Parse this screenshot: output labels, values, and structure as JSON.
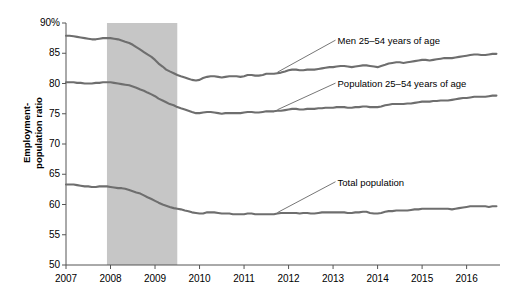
{
  "chart_data": {
    "type": "line",
    "title": "",
    "xlabel": "",
    "ylabel": "Employment-population ratio",
    "ylabel_line1": "Employment-",
    "ylabel_line2": "population ratio",
    "ylim": [
      50,
      90
    ],
    "ytick_values": [
      90,
      85,
      80,
      75,
      70,
      65,
      60,
      55,
      50
    ],
    "ytick_labels": [
      "90%",
      "85",
      "80",
      "75",
      "70",
      "65",
      "60",
      "55",
      "50"
    ],
    "xlim": [
      2007.0,
      2016.75
    ],
    "xtick_values": [
      2007,
      2008,
      2009,
      2010,
      2011,
      2012,
      2013,
      2014,
      2015,
      2016
    ],
    "xtick_labels": [
      "2007",
      "2008",
      "2009",
      "2010",
      "2011",
      "2012",
      "2013",
      "2014",
      "2015",
      "2016"
    ],
    "grid": false,
    "legend_position": "inline-annotations",
    "line_color": "#6e6e6e",
    "recession_band": {
      "label": "recession shading",
      "x_start": 2007.92,
      "x_end": 2009.5,
      "color": "#c6c6c6"
    },
    "annotations": [
      {
        "name": "men-25-54-label",
        "text": "Men 25–54 years of age",
        "x": 2013.1,
        "y": 87.0
      },
      {
        "name": "population-25-54-label",
        "text": "Population 25–54 years of age",
        "x": 2013.1,
        "y": 79.9
      },
      {
        "name": "total-population-label",
        "text": "Total population",
        "x": 2013.1,
        "y": 63.6
      }
    ],
    "series": [
      {
        "name": "Men 25–54 years of age",
        "color": "#6e6e6e",
        "x": [
          2007.0,
          2007.08,
          2007.17,
          2007.25,
          2007.33,
          2007.42,
          2007.5,
          2007.58,
          2007.67,
          2007.75,
          2007.83,
          2007.92,
          2008.0,
          2008.08,
          2008.17,
          2008.25,
          2008.33,
          2008.42,
          2008.5,
          2008.58,
          2008.67,
          2008.75,
          2008.83,
          2008.92,
          2009.0,
          2009.08,
          2009.17,
          2009.25,
          2009.33,
          2009.42,
          2009.5,
          2009.58,
          2009.67,
          2009.75,
          2009.83,
          2009.92,
          2010.0,
          2010.08,
          2010.17,
          2010.25,
          2010.33,
          2010.42,
          2010.5,
          2010.58,
          2010.67,
          2010.75,
          2010.83,
          2010.92,
          2011.0,
          2011.08,
          2011.17,
          2011.25,
          2011.33,
          2011.42,
          2011.5,
          2011.58,
          2011.67,
          2011.75,
          2011.83,
          2011.92,
          2012.0,
          2012.08,
          2012.17,
          2012.25,
          2012.33,
          2012.42,
          2012.5,
          2012.58,
          2012.67,
          2012.75,
          2012.83,
          2012.92,
          2013.0,
          2013.08,
          2013.17,
          2013.25,
          2013.33,
          2013.42,
          2013.5,
          2013.58,
          2013.67,
          2013.75,
          2013.83,
          2013.92,
          2014.0,
          2014.08,
          2014.17,
          2014.25,
          2014.33,
          2014.42,
          2014.5,
          2014.58,
          2014.67,
          2014.75,
          2014.83,
          2014.92,
          2015.0,
          2015.08,
          2015.17,
          2015.25,
          2015.33,
          2015.42,
          2015.5,
          2015.58,
          2015.67,
          2015.75,
          2015.83,
          2015.92,
          2016.0,
          2016.08,
          2016.17,
          2016.25,
          2016.33,
          2016.42,
          2016.5,
          2016.58,
          2016.67
        ],
        "values": [
          87.9,
          87.9,
          87.8,
          87.7,
          87.6,
          87.5,
          87.4,
          87.3,
          87.3,
          87.4,
          87.5,
          87.5,
          87.5,
          87.4,
          87.3,
          87.1,
          86.9,
          86.7,
          86.4,
          86.0,
          85.6,
          85.2,
          84.8,
          84.4,
          83.9,
          83.3,
          82.8,
          82.3,
          82.0,
          81.7,
          81.4,
          81.2,
          81.0,
          80.8,
          80.6,
          80.5,
          80.6,
          80.9,
          81.1,
          81.2,
          81.2,
          81.1,
          81.0,
          81.1,
          81.2,
          81.2,
          81.2,
          81.1,
          81.2,
          81.4,
          81.4,
          81.3,
          81.3,
          81.4,
          81.6,
          81.6,
          81.6,
          81.7,
          81.8,
          82.0,
          82.2,
          82.3,
          82.3,
          82.2,
          82.2,
          82.3,
          82.3,
          82.3,
          82.4,
          82.5,
          82.6,
          82.7,
          82.7,
          82.8,
          82.9,
          82.9,
          82.8,
          82.7,
          82.8,
          82.9,
          83.0,
          83.0,
          82.9,
          82.8,
          82.7,
          82.9,
          83.1,
          83.3,
          83.4,
          83.5,
          83.5,
          83.4,
          83.5,
          83.6,
          83.7,
          83.8,
          83.9,
          83.9,
          83.8,
          83.9,
          84.0,
          84.1,
          84.2,
          84.2,
          84.2,
          84.3,
          84.4,
          84.5,
          84.6,
          84.7,
          84.8,
          84.8,
          84.7,
          84.7,
          84.8,
          84.9,
          84.9
        ]
      },
      {
        "name": "Population 25–54 years of age",
        "color": "#6e6e6e",
        "x": [
          2007.0,
          2007.08,
          2007.17,
          2007.25,
          2007.33,
          2007.42,
          2007.5,
          2007.58,
          2007.67,
          2007.75,
          2007.83,
          2007.92,
          2008.0,
          2008.08,
          2008.17,
          2008.25,
          2008.33,
          2008.42,
          2008.5,
          2008.58,
          2008.67,
          2008.75,
          2008.83,
          2008.92,
          2009.0,
          2009.08,
          2009.17,
          2009.25,
          2009.33,
          2009.42,
          2009.5,
          2009.58,
          2009.67,
          2009.75,
          2009.83,
          2009.92,
          2010.0,
          2010.08,
          2010.17,
          2010.25,
          2010.33,
          2010.42,
          2010.5,
          2010.58,
          2010.67,
          2010.75,
          2010.83,
          2010.92,
          2011.0,
          2011.08,
          2011.17,
          2011.25,
          2011.33,
          2011.42,
          2011.5,
          2011.58,
          2011.67,
          2011.75,
          2011.83,
          2011.92,
          2012.0,
          2012.08,
          2012.17,
          2012.25,
          2012.33,
          2012.42,
          2012.5,
          2012.58,
          2012.67,
          2012.75,
          2012.83,
          2012.92,
          2013.0,
          2013.08,
          2013.17,
          2013.25,
          2013.33,
          2013.42,
          2013.5,
          2013.58,
          2013.67,
          2013.75,
          2013.83,
          2013.92,
          2014.0,
          2014.08,
          2014.17,
          2014.25,
          2014.33,
          2014.42,
          2014.5,
          2014.58,
          2014.67,
          2014.75,
          2014.83,
          2014.92,
          2015.0,
          2015.08,
          2015.17,
          2015.25,
          2015.33,
          2015.42,
          2015.5,
          2015.58,
          2015.67,
          2015.75,
          2015.83,
          2015.92,
          2016.0,
          2016.08,
          2016.17,
          2016.25,
          2016.33,
          2016.42,
          2016.5,
          2016.58,
          2016.67
        ],
        "values": [
          80.2,
          80.2,
          80.2,
          80.1,
          80.1,
          80.0,
          80.0,
          80.0,
          80.1,
          80.1,
          80.2,
          80.2,
          80.2,
          80.1,
          80.0,
          79.9,
          79.8,
          79.7,
          79.5,
          79.3,
          79.0,
          78.8,
          78.5,
          78.2,
          77.9,
          77.5,
          77.2,
          76.9,
          76.6,
          76.4,
          76.1,
          75.9,
          75.7,
          75.5,
          75.3,
          75.1,
          75.1,
          75.2,
          75.3,
          75.3,
          75.2,
          75.1,
          75.0,
          75.1,
          75.1,
          75.1,
          75.1,
          75.1,
          75.2,
          75.3,
          75.3,
          75.2,
          75.2,
          75.3,
          75.4,
          75.4,
          75.4,
          75.5,
          75.5,
          75.6,
          75.7,
          75.8,
          75.8,
          75.7,
          75.7,
          75.8,
          75.8,
          75.8,
          75.9,
          75.9,
          76.0,
          76.0,
          76.0,
          76.1,
          76.1,
          76.1,
          76.0,
          76.0,
          76.1,
          76.1,
          76.2,
          76.2,
          76.1,
          76.1,
          76.1,
          76.2,
          76.4,
          76.5,
          76.6,
          76.6,
          76.6,
          76.6,
          76.7,
          76.7,
          76.8,
          76.9,
          77.0,
          77.0,
          77.0,
          77.1,
          77.1,
          77.2,
          77.2,
          77.2,
          77.3,
          77.4,
          77.5,
          77.6,
          77.6,
          77.7,
          77.8,
          77.8,
          77.8,
          77.8,
          77.9,
          78.0,
          78.0
        ]
      },
      {
        "name": "Total population",
        "color": "#6e6e6e",
        "x": [
          2007.0,
          2007.08,
          2007.17,
          2007.25,
          2007.33,
          2007.42,
          2007.5,
          2007.58,
          2007.67,
          2007.75,
          2007.83,
          2007.92,
          2008.0,
          2008.08,
          2008.17,
          2008.25,
          2008.33,
          2008.42,
          2008.5,
          2008.58,
          2008.67,
          2008.75,
          2008.83,
          2008.92,
          2009.0,
          2009.08,
          2009.17,
          2009.25,
          2009.33,
          2009.42,
          2009.5,
          2009.58,
          2009.67,
          2009.75,
          2009.83,
          2009.92,
          2010.0,
          2010.08,
          2010.17,
          2010.25,
          2010.33,
          2010.42,
          2010.5,
          2010.58,
          2010.67,
          2010.75,
          2010.83,
          2010.92,
          2011.0,
          2011.08,
          2011.17,
          2011.25,
          2011.33,
          2011.42,
          2011.5,
          2011.58,
          2011.67,
          2011.75,
          2011.83,
          2011.92,
          2012.0,
          2012.08,
          2012.17,
          2012.25,
          2012.33,
          2012.42,
          2012.5,
          2012.58,
          2012.67,
          2012.75,
          2012.83,
          2012.92,
          2013.0,
          2013.08,
          2013.17,
          2013.25,
          2013.33,
          2013.42,
          2013.5,
          2013.58,
          2013.67,
          2013.75,
          2013.83,
          2013.92,
          2014.0,
          2014.08,
          2014.17,
          2014.25,
          2014.33,
          2014.42,
          2014.5,
          2014.58,
          2014.67,
          2014.75,
          2014.83,
          2014.92,
          2015.0,
          2015.08,
          2015.17,
          2015.25,
          2015.33,
          2015.42,
          2015.5,
          2015.58,
          2015.67,
          2015.75,
          2015.83,
          2015.92,
          2016.0,
          2016.08,
          2016.17,
          2016.25,
          2016.33,
          2016.42,
          2016.5,
          2016.58,
          2016.67
        ],
        "values": [
          63.3,
          63.3,
          63.3,
          63.2,
          63.1,
          63.0,
          63.0,
          62.9,
          62.9,
          63.0,
          63.0,
          63.0,
          62.9,
          62.8,
          62.7,
          62.7,
          62.6,
          62.4,
          62.2,
          62.0,
          61.8,
          61.5,
          61.2,
          60.9,
          60.6,
          60.3,
          60.0,
          59.8,
          59.6,
          59.4,
          59.3,
          59.2,
          59.0,
          58.9,
          58.7,
          58.6,
          58.5,
          58.5,
          58.7,
          58.7,
          58.7,
          58.6,
          58.5,
          58.5,
          58.5,
          58.4,
          58.4,
          58.4,
          58.4,
          58.5,
          58.5,
          58.4,
          58.4,
          58.4,
          58.4,
          58.4,
          58.4,
          58.5,
          58.6,
          58.6,
          58.6,
          58.6,
          58.6,
          58.5,
          58.6,
          58.6,
          58.5,
          58.5,
          58.6,
          58.7,
          58.7,
          58.7,
          58.7,
          58.7,
          58.7,
          58.7,
          58.6,
          58.6,
          58.7,
          58.7,
          58.8,
          58.8,
          58.6,
          58.5,
          58.5,
          58.6,
          58.8,
          58.9,
          58.9,
          59.0,
          59.0,
          59.0,
          59.0,
          59.1,
          59.2,
          59.2,
          59.3,
          59.3,
          59.3,
          59.3,
          59.3,
          59.3,
          59.3,
          59.3,
          59.2,
          59.3,
          59.4,
          59.5,
          59.6,
          59.7,
          59.7,
          59.7,
          59.7,
          59.7,
          59.6,
          59.7,
          59.7
        ]
      }
    ]
  },
  "axis": {
    "y_title_line1": "Employment-",
    "y_title_line2": "population ratio"
  }
}
